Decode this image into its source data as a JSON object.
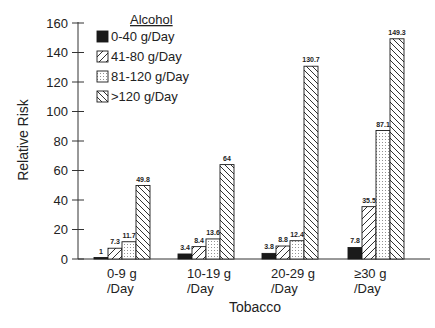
{
  "chart_data": {
    "type": "bar",
    "title": "",
    "xlabel": "Tobacco",
    "ylabel": "Relative Risk",
    "ylim": [
      0,
      160
    ],
    "yticks": [
      0,
      20,
      40,
      60,
      80,
      100,
      120,
      140,
      160
    ],
    "grid": false,
    "legend_title": "Alcohol",
    "legend_position": "upper-left",
    "categories": [
      {
        "line1": "0-9 g",
        "line2": "/Day"
      },
      {
        "line1": "10-19 g",
        "line2": "/Day"
      },
      {
        "line1": "20-29 g",
        "line2": "/Day"
      },
      {
        "line1": "≥30 g",
        "line2": "/Day"
      }
    ],
    "series": [
      {
        "name": "0-40 g/Day",
        "pattern": "solid",
        "values": [
          1,
          3.4,
          3.8,
          7.8
        ],
        "labels": [
          "1",
          "3.4",
          "3.8",
          "7.8"
        ]
      },
      {
        "name": "41-80 g/Day",
        "pattern": "diagonal-forward",
        "values": [
          7.3,
          8.4,
          8.8,
          35.5
        ],
        "labels": [
          "7.3",
          "8.4",
          "8.8",
          "35.5"
        ]
      },
      {
        "name": "81-120 g/Day",
        "pattern": "dotted",
        "values": [
          11.7,
          13.6,
          12.4,
          87.1
        ],
        "labels": [
          "11.7",
          "13.6",
          "12.4",
          "87.1"
        ]
      },
      {
        "name": ">120 g/Day",
        "pattern": "diagonal-back",
        "values": [
          49.8,
          64,
          130.7,
          149.3
        ],
        "labels": [
          "49.8",
          "64",
          "130.7",
          "149.3"
        ]
      }
    ]
  },
  "colors": {
    "ink": "#1a1a1a",
    "background": "#ffffff"
  }
}
